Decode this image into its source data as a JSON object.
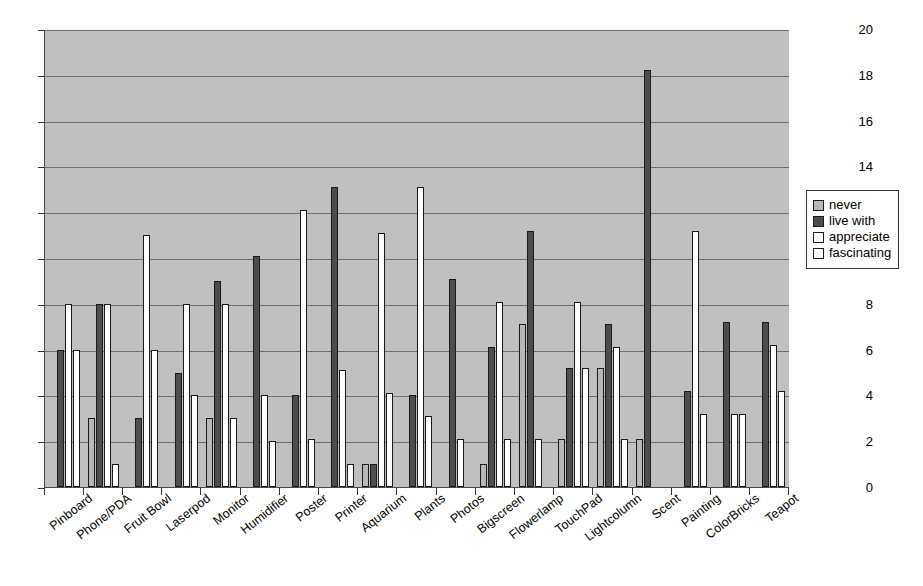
{
  "chart_data": {
    "type": "bar",
    "title": "",
    "xlabel": "",
    "ylabel": "",
    "ylim": [
      0,
      20
    ],
    "ytick_step": 2,
    "yticks": [
      0,
      2,
      4,
      6,
      8,
      10,
      12,
      14,
      16,
      18,
      20
    ],
    "grid": true,
    "legend_position": "right",
    "plot_background": "#c0c0c0",
    "categories": [
      "Pinboard",
      "Phone/PDA",
      "Fruit Bowl",
      "Laserpod",
      "Monitor",
      "Humidifier",
      "Poster",
      "Printer",
      "Aquarium",
      "Plants",
      "Photos",
      "Bigscreen",
      "Flowerlamp",
      "TouchPad",
      "Lightcolumn",
      "Scent",
      "Painting",
      "ColorBricks",
      "Teapot"
    ],
    "series": [
      {
        "name": "never",
        "color": "#b8b8b8",
        "values": [
          0,
          3,
          0,
          0,
          3,
          0,
          0,
          0,
          1,
          0,
          0,
          1,
          7.1,
          2.1,
          5.2,
          2.1,
          0,
          0,
          0
        ]
      },
      {
        "name": "live with",
        "color": "#4d4d4d",
        "values": [
          6,
          8,
          3,
          5,
          9,
          10.1,
          4,
          13.1,
          1,
          4,
          9.1,
          6.1,
          11.2,
          5.2,
          7.1,
          18.2,
          4.2,
          7.2,
          7.2
        ]
      },
      {
        "name": "appreciate",
        "color": "#ffffff",
        "values": [
          8,
          8,
          11,
          8,
          8,
          4,
          12.1,
          5.1,
          11.1,
          13.1,
          2.1,
          8.1,
          2.1,
          8.1,
          6.1,
          0,
          11.2,
          3.2,
          6.2
        ]
      },
      {
        "name": "fascinating",
        "color": "#ffffff",
        "values": [
          6,
          1,
          6,
          4,
          3,
          2,
          2.1,
          1,
          4.1,
          3.1,
          0,
          2.1,
          0,
          5.2,
          2.1,
          0,
          3.2,
          3.2,
          4.2
        ]
      }
    ]
  },
  "legend": {
    "items": [
      {
        "label": "never"
      },
      {
        "label": "live with"
      },
      {
        "label": "appreciate"
      },
      {
        "label": "fascinating"
      }
    ]
  }
}
